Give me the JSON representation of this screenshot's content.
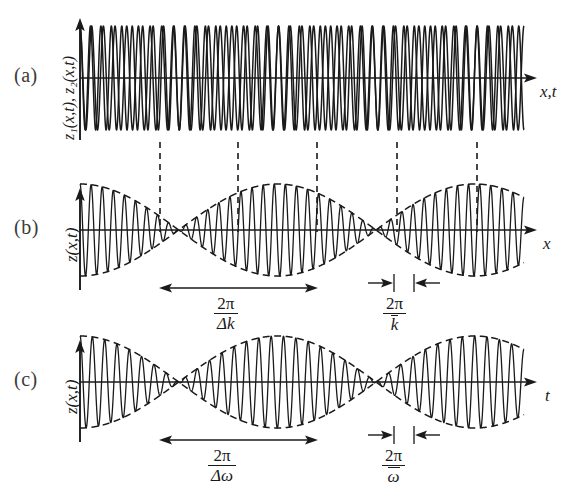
{
  "figure": {
    "background_color": "#ffffff",
    "ink_color": "#1a1a1a",
    "tag_color": "#3a3a3a",
    "width": 574,
    "height": 489
  },
  "panels": [
    {
      "tag": "(a)",
      "ylabel": "z₁(x,t), z₂(x,t)",
      "xlabel": "x,t",
      "description": "two superposed sinusoids of slightly different frequency"
    },
    {
      "tag": "(b)",
      "ylabel": "z(x,t)",
      "xlabel": "x",
      "description": "beat pattern with dashed envelope versus position"
    },
    {
      "tag": "(c)",
      "ylabel": "z(x,t)",
      "xlabel": "t",
      "description": "beat pattern with dashed envelope versus time"
    }
  ],
  "measures": [
    {
      "panel": "b",
      "kind": "wide",
      "numerator": "2π",
      "denominator": "Δk",
      "denominator_overbar": false
    },
    {
      "panel": "b",
      "kind": "narrow",
      "numerator": "2π",
      "denominator": "k",
      "denominator_overbar": true
    },
    {
      "panel": "c",
      "kind": "wide",
      "numerator": "2π",
      "denominator": "Δω",
      "denominator_overbar": false
    },
    {
      "panel": "c",
      "kind": "narrow",
      "numerator": "2π",
      "denominator": "ω",
      "denominator_overbar": true
    }
  ],
  "chart_data": {
    "type": "line",
    "title": "",
    "xlabel": "",
    "ylabel": "",
    "grid": false,
    "legend": "none",
    "panel_a": {
      "type": "line",
      "series": [
        {
          "name": "z1(x,t)",
          "form": "A*cos(k1*x)",
          "amplitude": 1.0,
          "cycles_across_axis": 38,
          "style": "solid"
        },
        {
          "name": "z2(x,t)",
          "form": "A*cos(k2*x)",
          "amplitude": 1.0,
          "cycles_across_axis": 42.5,
          "style": "solid"
        }
      ],
      "xlim": [
        0,
        1
      ],
      "ylim": [
        -1,
        1
      ]
    },
    "panel_b": {
      "type": "line",
      "series": [
        {
          "name": "z(x,t)",
          "form": "2A*cos(dk*x/2)*cos(kbar*x)",
          "amplitude": 1.0,
          "carrier_cycles": 40,
          "envelope_cycles": 2.25,
          "style": "solid"
        },
        {
          "name": "envelope+",
          "form": "+2A*cos(dk*x/2)",
          "style": "dashed"
        },
        {
          "name": "envelope-",
          "form": "-2A*cos(dk*x/2)",
          "style": "dashed"
        }
      ],
      "xlim": [
        0,
        1
      ],
      "ylim": [
        -1,
        1
      ]
    },
    "panel_c": {
      "type": "line",
      "series": [
        {
          "name": "z(x,t)",
          "form": "2A*cos(dw*t/2)*cos(wbar*t)",
          "amplitude": 1.0,
          "carrier_cycles": 36,
          "envelope_cycles": 2.25,
          "style": "solid"
        },
        {
          "name": "envelope+",
          "form": "+2A*cos(dw*t/2)",
          "style": "dashed"
        },
        {
          "name": "envelope-",
          "form": "-2A*cos(dw*t/2)",
          "style": "dashed"
        }
      ],
      "xlim": [
        0,
        1
      ],
      "ylim": [
        -1,
        1
      ]
    },
    "node_guides_x": [
      160,
      238,
      317,
      397,
      477
    ]
  }
}
